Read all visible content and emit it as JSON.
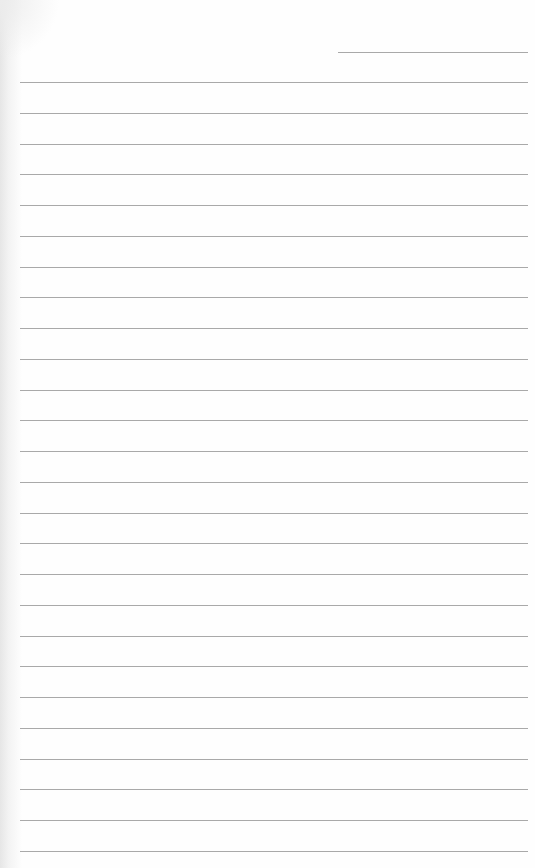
{
  "page": {
    "type": "lined-paper",
    "background_color": "#fefefe",
    "rule_color": "#9a9a9a",
    "header_rule": {
      "x": 338,
      "y": 52,
      "width": 190
    },
    "body_rules": {
      "count": 26,
      "start_y": 82,
      "spacing": 30.76,
      "x": 20,
      "width": 508
    }
  }
}
